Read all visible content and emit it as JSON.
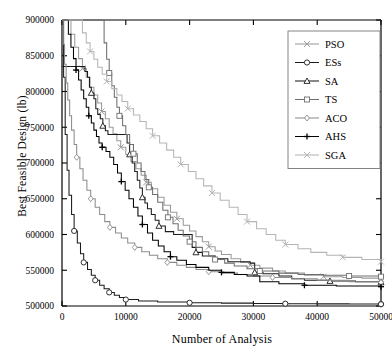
{
  "chart_data": {
    "type": "line",
    "title": "",
    "xlabel": "Number of Analysis",
    "ylabel": "Best Feasible Design (lb)",
    "xlim": [
      0,
      50000
    ],
    "ylim": [
      500000,
      900000
    ],
    "xticks": [
      0,
      10000,
      20000,
      30000,
      40000,
      50000
    ],
    "yticks": [
      500000,
      550000,
      600000,
      650000,
      700000,
      750000,
      800000,
      850000,
      900000
    ],
    "xtick_labels": [
      "0",
      "10000",
      "20000",
      "30000",
      "40000",
      "50000"
    ],
    "ytick_labels": [
      "500000",
      "550000",
      "600000",
      "650000",
      "700000",
      "750000",
      "800000",
      "850000",
      "900000"
    ],
    "grid": false,
    "legend_position": "top-right",
    "series": [
      {
        "name": "PSO",
        "marker": "cross-x",
        "color": "#9a9a9a",
        "points": [
          [
            0,
            900000
          ],
          [
            900,
            900000
          ],
          [
            1400,
            880000
          ],
          [
            2000,
            862000
          ],
          [
            2600,
            846000
          ],
          [
            3200,
            832000
          ],
          [
            3800,
            820000
          ],
          [
            4400,
            806000
          ],
          [
            5000,
            795000
          ],
          [
            5600,
            784000
          ],
          [
            6200,
            772000
          ],
          [
            6800,
            762000
          ],
          [
            7400,
            750000
          ],
          [
            8000,
            741000
          ],
          [
            8600,
            731000
          ],
          [
            9200,
            722000
          ],
          [
            10000,
            712000
          ],
          [
            10800,
            702000
          ],
          [
            11600,
            692000
          ],
          [
            12400,
            683000
          ],
          [
            13200,
            673000
          ],
          [
            14000,
            664000
          ],
          [
            15000,
            652000
          ],
          [
            16000,
            641000
          ],
          [
            17000,
            631000
          ],
          [
            18000,
            622000
          ],
          [
            19000,
            613000
          ],
          [
            20000,
            605000
          ],
          [
            21000,
            597000
          ],
          [
            22000,
            590000
          ],
          [
            23000,
            583000
          ],
          [
            24000,
            577000
          ],
          [
            25000,
            572000
          ],
          [
            26500,
            566000
          ],
          [
            28000,
            561000
          ],
          [
            29500,
            557000
          ],
          [
            31000,
            553000
          ],
          [
            33000,
            549000
          ],
          [
            35000,
            546000
          ],
          [
            38000,
            543000
          ],
          [
            41000,
            541000
          ],
          [
            44000,
            540000
          ],
          [
            47000,
            539000
          ],
          [
            50000,
            538000
          ]
        ]
      },
      {
        "name": "ESs",
        "marker": "circle",
        "color": "#1b1b1b",
        "points": [
          [
            0,
            900000
          ],
          [
            250,
            820000
          ],
          [
            500,
            740000
          ],
          [
            800,
            690000
          ],
          [
            1100,
            655000
          ],
          [
            1500,
            628000
          ],
          [
            1900,
            605000
          ],
          [
            2400,
            588000
          ],
          [
            2900,
            573000
          ],
          [
            3400,
            561000
          ],
          [
            4000,
            551000
          ],
          [
            4600,
            543000
          ],
          [
            5200,
            536000
          ],
          [
            5900,
            529000
          ],
          [
            6600,
            524000
          ],
          [
            7400,
            519000
          ],
          [
            8200,
            515000
          ],
          [
            9000,
            512000
          ],
          [
            10000,
            509000
          ],
          [
            12000,
            507000
          ],
          [
            15000,
            505500
          ],
          [
            20000,
            504500
          ],
          [
            25000,
            504000
          ],
          [
            30000,
            503500
          ],
          [
            35000,
            503200
          ],
          [
            40000,
            503000
          ],
          [
            45000,
            502800
          ],
          [
            50000,
            502500
          ]
        ]
      },
      {
        "name": "SA",
        "marker": "triangle",
        "color": "#1b1b1b",
        "points": [
          [
            0,
            835000
          ],
          [
            3200,
            835000
          ],
          [
            3600,
            828000
          ],
          [
            4000,
            820000
          ],
          [
            4300,
            806000
          ],
          [
            4600,
            798000
          ],
          [
            5000,
            790000
          ],
          [
            5300,
            776000
          ],
          [
            5600,
            768000
          ],
          [
            6000,
            762000
          ],
          [
            6400,
            752000
          ],
          [
            6800,
            745000
          ],
          [
            7200,
            740000
          ],
          [
            9800,
            740000
          ],
          [
            10200,
            728000
          ],
          [
            10600,
            712000
          ],
          [
            11000,
            700000
          ],
          [
            11400,
            688000
          ],
          [
            11800,
            676000
          ],
          [
            12200,
            665000
          ],
          [
            12600,
            652000
          ],
          [
            13000,
            644000
          ],
          [
            13400,
            636000
          ],
          [
            14000,
            628000
          ],
          [
            14600,
            620000
          ],
          [
            15200,
            612000
          ],
          [
            16200,
            604000
          ],
          [
            17500,
            600000
          ],
          [
            20000,
            600000
          ],
          [
            20400,
            582000
          ],
          [
            21000,
            575000
          ],
          [
            22000,
            570000
          ],
          [
            24000,
            566000
          ],
          [
            26000,
            562000
          ],
          [
            29500,
            560000
          ],
          [
            30200,
            547000
          ],
          [
            31500,
            545000
          ],
          [
            34000,
            542000
          ],
          [
            36000,
            538000
          ],
          [
            38000,
            536000
          ],
          [
            42000,
            535000
          ],
          [
            46000,
            534000
          ],
          [
            50000,
            533000
          ]
        ]
      },
      {
        "name": "TS",
        "marker": "square",
        "color": "#6e6e6e",
        "points": [
          [
            0,
            900000
          ],
          [
            6200,
            900000
          ],
          [
            6600,
            868000
          ],
          [
            7000,
            845000
          ],
          [
            7400,
            826000
          ],
          [
            7800,
            808000
          ],
          [
            8200,
            792000
          ],
          [
            8600,
            778000
          ],
          [
            9000,
            766000
          ],
          [
            9500,
            752000
          ],
          [
            10000,
            740000
          ],
          [
            10600,
            726000
          ],
          [
            11200,
            713000
          ],
          [
            11800,
            700000
          ],
          [
            12400,
            688000
          ],
          [
            13000,
            677000
          ],
          [
            13600,
            666000
          ],
          [
            14200,
            656000
          ],
          [
            15000,
            645000
          ],
          [
            15800,
            634000
          ],
          [
            16600,
            624000
          ],
          [
            17400,
            615000
          ],
          [
            18200,
            606000
          ],
          [
            19000,
            598000
          ],
          [
            20000,
            590000
          ],
          [
            21000,
            582000
          ],
          [
            22000,
            576000
          ],
          [
            23000,
            570000
          ],
          [
            24000,
            565000
          ],
          [
            25500,
            560000
          ],
          [
            27000,
            556000
          ],
          [
            29000,
            552000
          ],
          [
            31000,
            549000
          ],
          [
            34000,
            546000
          ],
          [
            37000,
            544000
          ],
          [
            41000,
            543000
          ],
          [
            45000,
            542000
          ],
          [
            50000,
            541000
          ]
        ]
      },
      {
        "name": "ACO",
        "marker": "diamond",
        "color": "#8c8c8c",
        "points": [
          [
            0,
            900000
          ],
          [
            200,
            866000
          ],
          [
            400,
            838000
          ],
          [
            650,
            812000
          ],
          [
            900,
            788000
          ],
          [
            1200,
            766000
          ],
          [
            1500,
            746000
          ],
          [
            1900,
            726000
          ],
          [
            2300,
            708000
          ],
          [
            2800,
            692000
          ],
          [
            3300,
            676000
          ],
          [
            3900,
            662000
          ],
          [
            4500,
            650000
          ],
          [
            5200,
            638000
          ],
          [
            5900,
            628000
          ],
          [
            6700,
            618000
          ],
          [
            7500,
            610000
          ],
          [
            8400,
            602000
          ],
          [
            9300,
            595000
          ],
          [
            10300,
            588000
          ],
          [
            11400,
            582000
          ],
          [
            12500,
            576000
          ],
          [
            13700,
            571000
          ],
          [
            15000,
            566000
          ],
          [
            16500,
            561000
          ],
          [
            18000,
            557000
          ],
          [
            19500,
            554000
          ],
          [
            21000,
            551000
          ],
          [
            23000,
            548000
          ],
          [
            25000,
            546000
          ],
          [
            27500,
            544000
          ],
          [
            30000,
            542000
          ],
          [
            33000,
            540000
          ],
          [
            36000,
            538000
          ],
          [
            40000,
            536000
          ],
          [
            45000,
            534000
          ],
          [
            50000,
            533000
          ]
        ]
      },
      {
        "name": "AHS",
        "marker": "plus",
        "color": "#000000",
        "points": [
          [
            0,
            900000
          ],
          [
            600,
            900000
          ],
          [
            1000,
            880000
          ],
          [
            1400,
            862000
          ],
          [
            1800,
            846000
          ],
          [
            2200,
            830000
          ],
          [
            2600,
            816000
          ],
          [
            3000,
            802000
          ],
          [
            3400,
            790000
          ],
          [
            3800,
            778000
          ],
          [
            4200,
            766000
          ],
          [
            4600,
            756000
          ],
          [
            5000,
            746000
          ],
          [
            5400,
            737000
          ],
          [
            5800,
            728000
          ],
          [
            6300,
            722000
          ],
          [
            6900,
            716000
          ],
          [
            7500,
            708000
          ],
          [
            8100,
            698000
          ],
          [
            8700,
            686000
          ],
          [
            9300,
            674000
          ],
          [
            9900,
            662000
          ],
          [
            10500,
            650000
          ],
          [
            11200,
            638000
          ],
          [
            11900,
            626000
          ],
          [
            12600,
            614000
          ],
          [
            13400,
            602000
          ],
          [
            14200,
            592000
          ],
          [
            15100,
            584000
          ],
          [
            16000,
            576000
          ],
          [
            17000,
            569000
          ],
          [
            18000,
            564000
          ],
          [
            19500,
            558000
          ],
          [
            21000,
            554000
          ],
          [
            23000,
            550000
          ],
          [
            25000,
            547000
          ],
          [
            27000,
            544000
          ],
          [
            29000,
            542000
          ],
          [
            31000,
            534000
          ],
          [
            34000,
            531000
          ],
          [
            38000,
            529000
          ],
          [
            43000,
            528000
          ],
          [
            50000,
            527000
          ]
        ]
      },
      {
        "name": "SGA",
        "marker": "cross-x",
        "color": "#b5b5b5",
        "points": [
          [
            0,
            900000
          ],
          [
            2600,
            900000
          ],
          [
            3200,
            882000
          ],
          [
            3800,
            868000
          ],
          [
            4400,
            856000
          ],
          [
            5000,
            845000
          ],
          [
            5600,
            834000
          ],
          [
            6300,
            824000
          ],
          [
            7000,
            814000
          ],
          [
            7800,
            804000
          ],
          [
            8600,
            795000
          ],
          [
            9400,
            786000
          ],
          [
            10300,
            776000
          ],
          [
            11200,
            767000
          ],
          [
            12200,
            758000
          ],
          [
            13200,
            748000
          ],
          [
            14200,
            738000
          ],
          [
            15300,
            728000
          ],
          [
            16400,
            718000
          ],
          [
            17500,
            708000
          ],
          [
            18600,
            698000
          ],
          [
            19800,
            688000
          ],
          [
            21000,
            678000
          ],
          [
            22200,
            668000
          ],
          [
            23500,
            658000
          ],
          [
            24800,
            648000
          ],
          [
            26200,
            638000
          ],
          [
            27600,
            628000
          ],
          [
            29000,
            618000
          ],
          [
            30500,
            608000
          ],
          [
            32000,
            600000
          ],
          [
            33500,
            592000
          ],
          [
            35000,
            586000
          ],
          [
            37000,
            580000
          ],
          [
            39000,
            575000
          ],
          [
            41500,
            571000
          ],
          [
            44000,
            568000
          ],
          [
            47000,
            565000
          ],
          [
            50000,
            562000
          ]
        ]
      }
    ]
  },
  "legend": {
    "items": [
      {
        "label": "PSO"
      },
      {
        "label": "ESs"
      },
      {
        "label": "SA"
      },
      {
        "label": "TS"
      },
      {
        "label": "ACO"
      },
      {
        "label": "AHS"
      },
      {
        "label": "SGA"
      }
    ]
  }
}
